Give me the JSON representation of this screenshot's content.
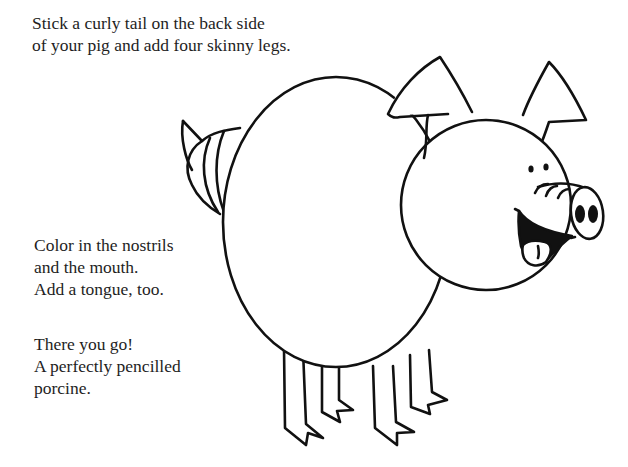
{
  "instructions": {
    "intro": {
      "line1": "Stick a curly tail on the back side",
      "line2": "of your pig and add four skinny legs."
    },
    "coloring": {
      "line1": "Color in the nostrils",
      "line2": "and the mouth.",
      "line3": "Add a tongue, too."
    },
    "closing": {
      "line1": "There you go!",
      "line2": "A perfectly pencilled",
      "line3": "porcine."
    }
  },
  "illustration": {
    "subject": "pig-line-drawing",
    "stroke_color": "#111111",
    "fill_color": "#ffffff",
    "parts": [
      "curly-tail",
      "body",
      "head",
      "left-ear",
      "right-ear",
      "eyes",
      "snout",
      "nostrils",
      "mouth",
      "tongue",
      "four-legs"
    ]
  }
}
